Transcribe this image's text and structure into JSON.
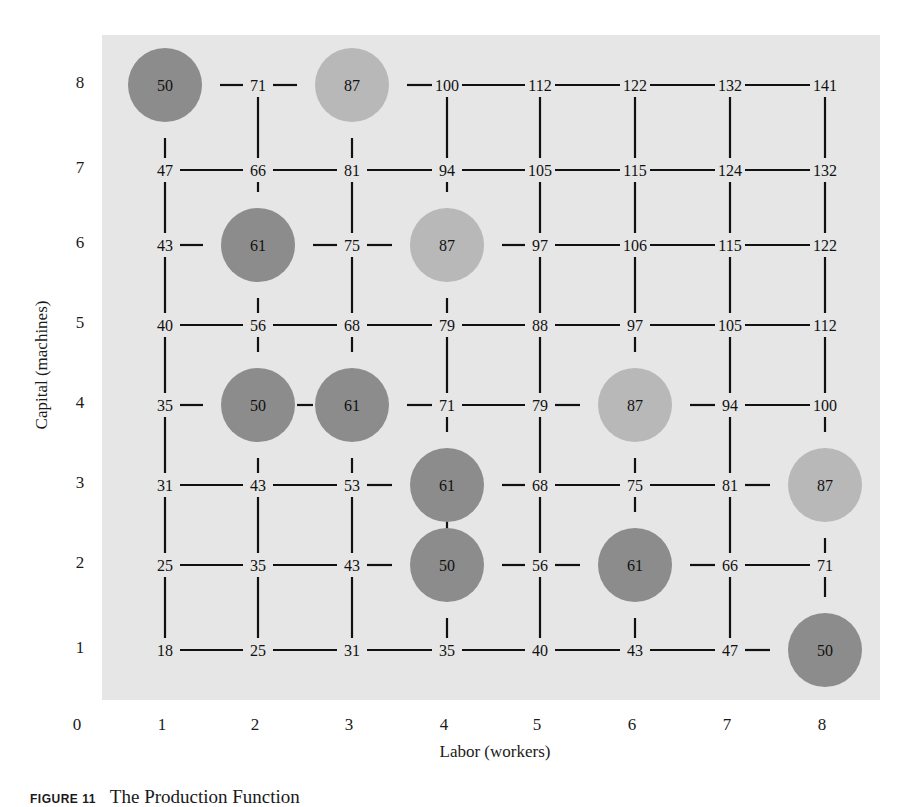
{
  "chart_data": {
    "type": "table",
    "title": "The Production Function",
    "figure_label": "FIGURE 11",
    "xlabel": "Labor (workers)",
    "ylabel": "Capital (machines)",
    "x_ticks": [
      "0",
      "1",
      "2",
      "3",
      "4",
      "5",
      "6",
      "7",
      "8"
    ],
    "y_ticks": [
      "1",
      "2",
      "3",
      "4",
      "5",
      "6",
      "7",
      "8"
    ],
    "labor": [
      1,
      2,
      3,
      4,
      5,
      6,
      7,
      8
    ],
    "capital": [
      8,
      7,
      6,
      5,
      4,
      3,
      2,
      1
    ],
    "output_grid": [
      [
        50,
        71,
        87,
        100,
        112,
        122,
        132,
        141
      ],
      [
        47,
        66,
        81,
        94,
        105,
        115,
        124,
        132
      ],
      [
        43,
        61,
        75,
        87,
        97,
        106,
        115,
        122
      ],
      [
        40,
        56,
        68,
        79,
        88,
        97,
        105,
        112
      ],
      [
        35,
        50,
        61,
        71,
        79,
        87,
        94,
        100
      ],
      [
        31,
        43,
        53,
        61,
        68,
        75,
        81,
        87
      ],
      [
        25,
        35,
        43,
        50,
        56,
        61,
        66,
        71
      ],
      [
        18,
        25,
        31,
        35,
        40,
        43,
        47,
        50
      ]
    ],
    "highlighted_isoquants": [
      {
        "output": 50,
        "shade": "dark",
        "points": [
          [
            1,
            8
          ],
          [
            2,
            4
          ],
          [
            4,
            2
          ],
          [
            8,
            1
          ]
        ]
      },
      {
        "output": 61,
        "shade": "dark",
        "points": [
          [
            2,
            6
          ],
          [
            3,
            4
          ],
          [
            4,
            3
          ],
          [
            6,
            2
          ]
        ]
      },
      {
        "output": 87,
        "shade": "light",
        "points": [
          [
            3,
            8
          ],
          [
            4,
            6
          ],
          [
            6,
            4
          ],
          [
            8,
            3
          ]
        ]
      }
    ],
    "colors": {
      "background": "#e6e6e6",
      "dark_circle": "#8c8c8c",
      "light_circle": "#b8b8b8",
      "line": "#111111"
    }
  },
  "caption": {
    "figure": "FIGURE 11",
    "title": "The Production Function"
  }
}
